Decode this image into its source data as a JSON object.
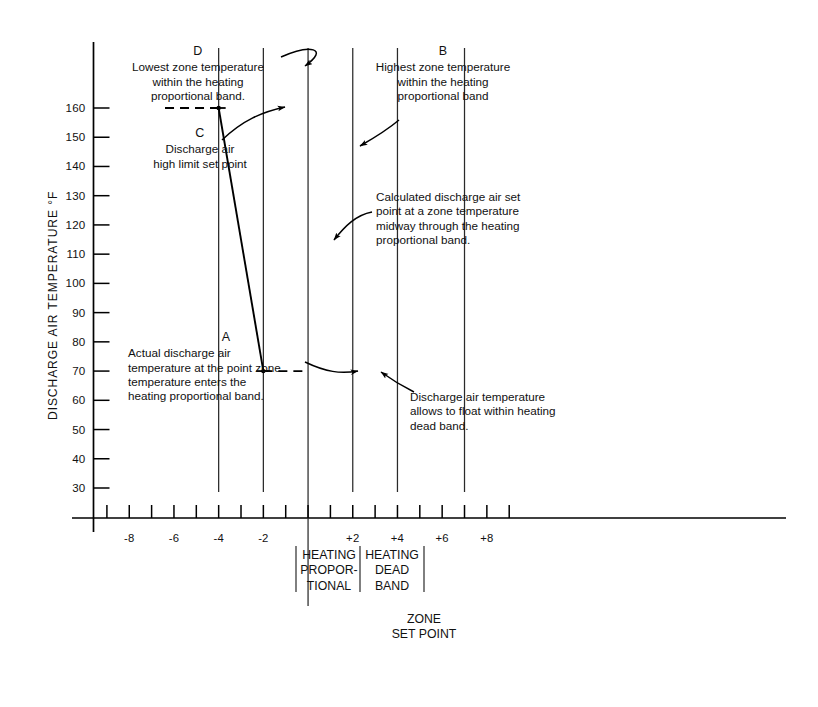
{
  "chart_data": {
    "type": "line",
    "title": "",
    "xlabel": "",
    "ylabel": "DISCHARGE AIR TEMPERATURE °F",
    "ylim": [
      25,
      168
    ],
    "xlim": [
      -9.6,
      9.6
    ],
    "grid": false,
    "y_ticks": [
      30,
      40,
      50,
      60,
      70,
      80,
      90,
      100,
      110,
      120,
      130,
      140,
      150,
      160
    ],
    "y_tick_labels": [
      "30",
      "40",
      "50",
      "60",
      "70",
      "80",
      "90",
      "100",
      "110",
      "120",
      "130",
      "140",
      "150",
      "160"
    ],
    "x_ticks": [
      -9,
      -8,
      -7,
      -6,
      -5,
      -4,
      -3,
      -2,
      -1,
      0,
      1,
      2,
      3,
      4,
      5,
      6,
      7,
      8,
      9
    ],
    "x_tick_labels": [
      {
        "x": -8,
        "label": "-8"
      },
      {
        "x": -6,
        "label": "-6"
      },
      {
        "x": -4,
        "label": "-4"
      },
      {
        "x": -2,
        "label": "-2"
      },
      {
        "x": 2,
        "label": "+2"
      },
      {
        "x": 4,
        "label": "+4"
      },
      {
        "x": 6,
        "label": "+6"
      },
      {
        "x": 8,
        "label": "+8"
      }
    ],
    "vertical_reference_lines": [
      -4,
      -2,
      0,
      2,
      4,
      7
    ],
    "series": [
      {
        "name": "Calculated discharge air set point",
        "style": "solid",
        "points": [
          [
            -4,
            160
          ],
          [
            -2,
            70
          ]
        ]
      },
      {
        "name": "Discharge air high limit set point",
        "style": "dashed",
        "points": [
          [
            -6.4,
            160
          ],
          [
            -4,
            160
          ]
        ]
      },
      {
        "name": "Discharge air floats within heating dead band",
        "style": "dashed",
        "points": [
          [
            -2,
            70
          ],
          [
            0,
            70
          ]
        ]
      }
    ],
    "markers": [
      {
        "x": -4,
        "y": 160,
        "label": "D"
      },
      {
        "x": -2,
        "y": 70,
        "label": "A"
      }
    ],
    "annotations": [
      {
        "id": "D",
        "letter": "D",
        "text": "Lowest zone temperature within the heating proportional band.",
        "target": [
          -4,
          166
        ]
      },
      {
        "id": "C",
        "letter": "C",
        "text": "Discharge air high limit set point",
        "target": [
          -5.1,
          160
        ]
      },
      {
        "id": "B",
        "letter": "B",
        "text": "Highest zone temperature within the heating proportional band",
        "target": [
          -2,
          141
        ]
      },
      {
        "id": "calc",
        "letter": "",
        "text": "Calculated discharge air set point at a zone temperature midway through the heating proportional band.",
        "target": [
          -3,
          115
        ]
      },
      {
        "id": "A",
        "letter": "A",
        "text": "Actual discharge air temperature at the point zone temperature enters the heating proportional band.",
        "target": [
          -2,
          70
        ]
      },
      {
        "id": "float",
        "letter": "",
        "text": "Discharge air temperature allows to float within heating dead band.",
        "target": [
          -1.2,
          72
        ]
      }
    ],
    "band_labels": [
      {
        "id": "heating-proportional",
        "lines": [
          "HEATING",
          "PROPOR-",
          "TIONAL"
        ],
        "from_x": -4,
        "to_x": -2
      },
      {
        "id": "heating-dead-band",
        "lines": [
          "HEATING",
          "DEAD",
          "BAND"
        ],
        "from_x": -2,
        "to_x": 0
      }
    ],
    "zone_set_point": {
      "lines": [
        "ZONE",
        "SET POINT"
      ],
      "x": 0
    }
  },
  "colors": {
    "ink": "#111111",
    "line": "#000000",
    "grid": "#2a2a2a",
    "background": "#ffffff"
  },
  "axis": {
    "y_title": "DISCHARGE AIR TEMPERATURE °F"
  },
  "annotation_text": {
    "d_letter": "D",
    "d_line1": "Lowest zone temperature",
    "d_line2": "within the heating",
    "d_line3": "proportional band.",
    "c_letter": "C",
    "c_line1": "Discharge air",
    "c_line2": "high limit set point",
    "b_letter": "B",
    "b_line1": "Highest zone temperature",
    "b_line2": "within the heating",
    "b_line3": "proportional band",
    "calc_line1": "Calculated discharge air set",
    "calc_line2": "point at a zone temperature",
    "calc_line3": "midway through the heating",
    "calc_line4": "proportional band.",
    "a_letter": "A",
    "a_line1": "Actual discharge air",
    "a_line2": "temperature at the point zone",
    "a_line3": "temperature enters the",
    "a_line4": "heating proportional band.",
    "float_line1": "Discharge air temperature",
    "float_line2": "allows to float within heating",
    "float_line3": "dead band."
  },
  "band_text": {
    "hp_1": "HEATING",
    "hp_2": "PROPOR-",
    "hp_3": "TIONAL",
    "hd_1": "HEATING",
    "hd_2": "DEAD",
    "hd_3": "BAND",
    "zone_1": "ZONE",
    "zone_2": "SET POINT"
  }
}
